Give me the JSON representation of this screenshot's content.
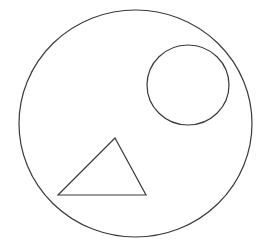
{
  "canvas": {
    "width": 269,
    "height": 246,
    "background": "#ffffff"
  },
  "stroke": {
    "color": "#3a3a3a",
    "width": 1.2
  },
  "shapes": {
    "outer_circle": {
      "cx": 135.5,
      "cy": 123.5,
      "rx": 116.5,
      "ry": 113.5
    },
    "inner_circle": {
      "cx": 188,
      "cy": 85,
      "rx": 41,
      "ry": 40
    },
    "triangle": {
      "points": "115,138 58,195 146,195"
    }
  }
}
